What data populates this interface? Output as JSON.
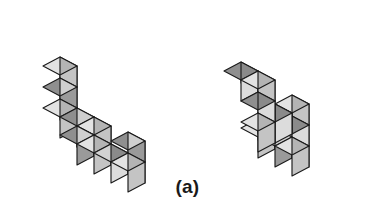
{
  "figure": {
    "caption": "(a)",
    "caption_position": {
      "x_center": 186,
      "y_top": 176
    },
    "kind": "mental-rotation-cube-pair",
    "background_color": "#ffffff",
    "outline_color": "#1b1b1b",
    "palette": {
      "top_light": "#e3e3e3",
      "top_mid": "#d2d2d2",
      "top_dark": "#8f8f8f",
      "left_light": "#cfcfcf",
      "left_mid": "#b4b4b4",
      "left_dark": "#8a8a8a",
      "right_light": "#dcdcdc",
      "right_mid": "#c4c4c4",
      "right_dark": "#9a9a9a"
    },
    "projection": {
      "unit_x": [
        17,
        9
      ],
      "unit_y": [
        -17,
        9
      ],
      "unit_z": [
        0,
        -21
      ]
    },
    "objects": [
      {
        "name": "left-object",
        "label": "left cube figure",
        "origin": {
          "x": 60,
          "y": 120
        },
        "cube_count": 10,
        "cubes": [
          [
            0,
            0,
            0
          ],
          [
            0,
            0,
            1
          ],
          [
            0,
            0,
            2
          ],
          [
            1,
            0,
            0
          ],
          [
            2,
            0,
            0
          ],
          [
            2,
            1,
            0
          ],
          [
            3,
            1,
            0
          ],
          [
            4,
            1,
            0
          ],
          [
            5,
            1,
            0
          ],
          [
            5,
            1,
            1
          ]
        ]
      },
      {
        "name": "right-object",
        "label": "right cube figure",
        "origin": {
          "x": 258,
          "y": 140
        },
        "cube_count": 10,
        "cubes": [
          [
            0,
            0,
            0
          ],
          [
            1,
            0,
            0
          ],
          [
            2,
            0,
            0
          ],
          [
            2,
            0,
            1
          ],
          [
            2,
            0,
            2
          ],
          [
            2,
            1,
            2
          ],
          [
            2,
            2,
            2
          ],
          [
            2,
            2,
            3
          ],
          [
            2,
            2,
            4
          ],
          [
            1,
            2,
            4
          ]
        ]
      }
    ]
  }
}
